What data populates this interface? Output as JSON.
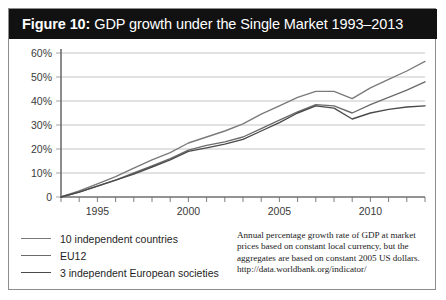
{
  "figure": {
    "label": "Figure 10:",
    "title": "GDP growth under the Single Market 1993–2013"
  },
  "source_note": {
    "text": "Annual percentage growth rate of GDP at market prices based on constant local currency, but the aggregates are based on constant 2005 US dollars.",
    "url": "http://data.worldbank.org/indicator/"
  },
  "legend": {
    "items": [
      {
        "label": "10 independent countries",
        "color": "#7a7a7a"
      },
      {
        "label": "EU12",
        "color": "#6b6b6b"
      },
      {
        "label": "3 independent European societies",
        "color": "#4a4a4a"
      }
    ]
  },
  "colors": {
    "title_bar_background": "#111111",
    "title_bar_text": "#ffffff",
    "frame_border": "#8d8d8d",
    "gridline": "#b6b6b6",
    "axis": "#6f6f6f",
    "plot_background": "#ffffff"
  },
  "chart_data": {
    "type": "line",
    "title": "GDP growth under the Single Market 1993–2013",
    "xlabel": "",
    "ylabel": "",
    "xlim": [
      1993,
      2013
    ],
    "ylim": [
      0,
      60
    ],
    "ytick_values": [
      0,
      10,
      20,
      30,
      40,
      50,
      60
    ],
    "ytick_labels": [
      "0",
      "10%",
      "20%",
      "30%",
      "40%",
      "50%",
      "60%"
    ],
    "x": [
      1993,
      1994,
      1995,
      1996,
      1997,
      1998,
      1999,
      2000,
      2001,
      2002,
      2003,
      2004,
      2005,
      2006,
      2007,
      2008,
      2009,
      2010,
      2011,
      2012,
      2013
    ],
    "xtick_values": [
      1993,
      1994,
      1995,
      1996,
      1997,
      1998,
      1999,
      2000,
      2001,
      2002,
      2003,
      2004,
      2005,
      2006,
      2007,
      2008,
      2009,
      2010,
      2011,
      2012,
      2013
    ],
    "xtick_labels_shown": [
      "1995",
      "2000",
      "2005",
      "2010"
    ],
    "xtick_labeled_values": [
      1995,
      2000,
      2005,
      2010
    ],
    "grid": "horizontal",
    "legend_position": "below-left",
    "series": [
      {
        "name": "10 independent countries",
        "color": "#7a7a7a",
        "values": [
          0,
          2.5,
          5.5,
          8.5,
          12.0,
          15.5,
          18.5,
          22.5,
          25.0,
          27.5,
          30.5,
          34.5,
          38.0,
          41.5,
          44.0,
          44.0,
          41.0,
          45.5,
          49.0,
          52.5,
          56.5
        ]
      },
      {
        "name": "EU12",
        "color": "#6b6b6b",
        "values": [
          0,
          2.0,
          4.5,
          7.0,
          10.0,
          13.0,
          16.0,
          19.5,
          21.5,
          23.0,
          25.0,
          28.5,
          32.0,
          35.5,
          38.5,
          38.0,
          35.0,
          38.5,
          41.5,
          44.5,
          48.0
        ]
      },
      {
        "name": "3 independent European societies",
        "color": "#4a4a4a",
        "values": [
          0,
          2.0,
          4.5,
          7.0,
          9.5,
          12.5,
          15.5,
          19.0,
          20.5,
          22.0,
          24.0,
          27.5,
          31.0,
          35.0,
          38.0,
          37.0,
          32.5,
          35.0,
          36.5,
          37.5,
          38.0
        ]
      }
    ]
  }
}
